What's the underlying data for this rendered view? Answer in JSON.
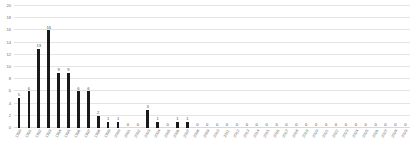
{
  "chart_data": {
    "type": "bar",
    "title": "",
    "subtitle": "",
    "xlabel": "",
    "ylabel": "",
    "ylim": [
      0,
      20
    ],
    "yticks": [
      20,
      18,
      16,
      14,
      12,
      10,
      8,
      6,
      4,
      2,
      0
    ],
    "grid": true,
    "legend": null,
    "bar_color": "#1a1a1a",
    "grid_color": "#e4e4e4",
    "text_color": "#6e6e6e",
    "data_labels_shown": true,
    "categories": [
      "1990",
      "1991",
      "1992",
      "1993",
      "1994",
      "1995",
      "1996",
      "1997",
      "1998",
      "1999",
      "2000",
      "2001",
      "2002",
      "2003",
      "2004",
      "2005",
      "2006",
      "2007",
      "2008",
      "2009",
      "2010",
      "2011",
      "2012",
      "2013",
      "2014",
      "2015",
      "2016",
      "2017",
      "2018",
      "2019",
      "2020",
      "2021",
      "2022",
      "2023",
      "2024",
      "2025",
      "2026",
      "2027",
      "2028",
      "2029"
    ],
    "values": [
      5,
      6,
      13,
      16,
      9,
      9,
      6,
      6,
      2,
      1,
      1,
      0,
      0,
      3,
      1,
      0,
      1,
      1,
      0,
      0,
      0,
      0,
      0,
      0,
      0,
      0,
      0,
      0,
      0,
      0,
      0,
      0,
      0,
      0,
      0,
      0,
      0,
      0,
      0,
      0
    ]
  }
}
